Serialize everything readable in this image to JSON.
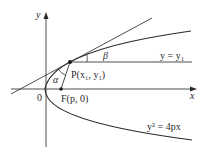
{
  "figure": {
    "type": "parabola-reflection-property",
    "colors": {
      "background": "#ffffff",
      "stroke": "#3a3a3a",
      "text": "#2a2a2a"
    },
    "axes": {
      "x_label": "x",
      "y_label": "y",
      "origin_label": "0"
    },
    "labels": {
      "point_p": "P(x₁, y₁)",
      "point_f": "F(p, 0)",
      "horizontal_line": "y = y₁",
      "curve_equation": "y² = 4px",
      "angle_alpha": "α",
      "angle_beta": "β"
    }
  }
}
